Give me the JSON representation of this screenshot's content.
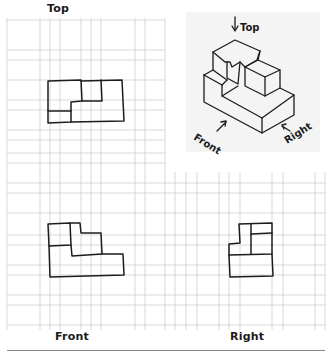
{
  "worksheet": {
    "views": {
      "top": {
        "label": "Top"
      },
      "front": {
        "label": "Front"
      },
      "right": {
        "label": "Right"
      }
    },
    "isometric": {
      "arrow_labels": {
        "top": "Top",
        "front": "Front",
        "right": "Right"
      }
    }
  },
  "colors": {
    "grid": "#cfcfcf",
    "ink": "#1c1c1c",
    "background": "#ffffff",
    "iso_background": "#f4f4f4"
  }
}
